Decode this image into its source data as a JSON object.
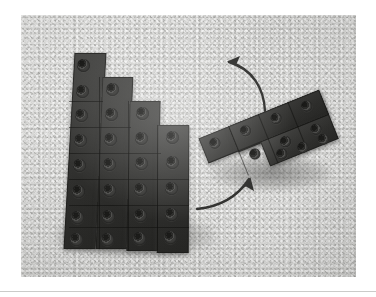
{
  "document": {
    "kind": "photograph",
    "subject": "two dark interlocking construction-brick assemblies on a light speckled surface",
    "palette": {
      "page_background": "#ffffff",
      "photo_surface": "#cfcfcd",
      "brick_dark": "#33332f",
      "brick_highlight": "#4f4f4d",
      "stud_hole": "#1a1a18",
      "arrow_stroke": "#2f2f2d",
      "baseline_rule": "#bebebc"
    },
    "caption": ""
  },
  "photo": {
    "left": 21,
    "top": 15,
    "width": 335,
    "height": 262,
    "alt": "grayscale photo of a staircase-shaped brick plate and a smaller angled brick plate with two curved motion arrows"
  },
  "objects": {
    "left_assembly": {
      "name": "staircase-plate-assembly",
      "description": "tall stepped stack of dark brick plates forming a descending staircase on its upper-right side",
      "columns": 4,
      "rows": 7,
      "step_count": 4,
      "stud_count": 24
    },
    "right_assembly": {
      "name": "angled-plate-assembly",
      "description": "smaller L / wedge shaped dark brick plate tilted roughly 25 degrees",
      "columns": 4,
      "rows": 3,
      "stud_count": 12,
      "rotation_degrees": -22
    }
  },
  "annotations": {
    "arrows": [
      {
        "id": "upper-arrow",
        "name": "rotate-arrow-up-left",
        "direction": "up-left",
        "meaning": "lift and rotate the small piece",
        "head_at": "top-left"
      },
      {
        "id": "lower-arrow",
        "name": "move-arrow-up-right",
        "direction": "up-right",
        "meaning": "attach the small piece to the staircase",
        "head_at": "top-right"
      }
    ]
  }
}
